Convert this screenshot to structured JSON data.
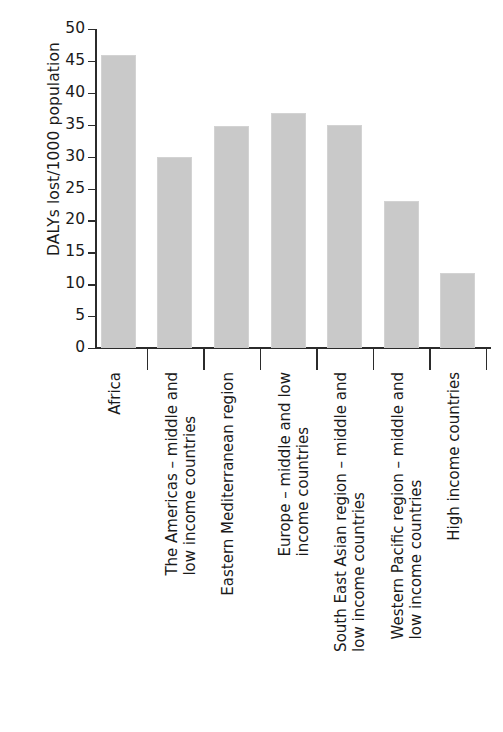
{
  "chart_data": {
    "type": "bar",
    "title": "",
    "xlabel": "",
    "ylabel": "DALYs lost/1000 population",
    "ylim": [
      0,
      50
    ],
    "yticks": [
      0,
      5,
      10,
      15,
      20,
      25,
      30,
      35,
      40,
      45,
      50
    ],
    "grid": false,
    "legend": "none",
    "bar_color": "#c9c9c9",
    "axis_color": "#2b2b2b",
    "categories": [
      "Africa",
      "The Americas – middle and low income countries",
      "Eastern Mediterranean region",
      "Europe – middle and low income countries",
      "South East Asian region – middle and low income countries",
      "Western Pacific region – middle and low income countries",
      "High income countries"
    ],
    "category_lines": [
      [
        "Africa"
      ],
      [
        "The Americas – middle and",
        "low income countries"
      ],
      [
        "Eastern Mediterranean region"
      ],
      [
        "Europe – middle and low",
        "income countries"
      ],
      [
        "South East Asian region – middle and",
        "low income countries"
      ],
      [
        "Western Pacific region – middle and",
        "low income countries"
      ],
      [
        "High income countries"
      ]
    ],
    "values": [
      46.0,
      30.0,
      34.8,
      36.8,
      35.0,
      23.0,
      11.7
    ],
    "ytick_labels": [
      "0",
      "5",
      "10",
      "15",
      "20",
      "25",
      "30",
      "35",
      "40",
      "45",
      "50"
    ]
  }
}
